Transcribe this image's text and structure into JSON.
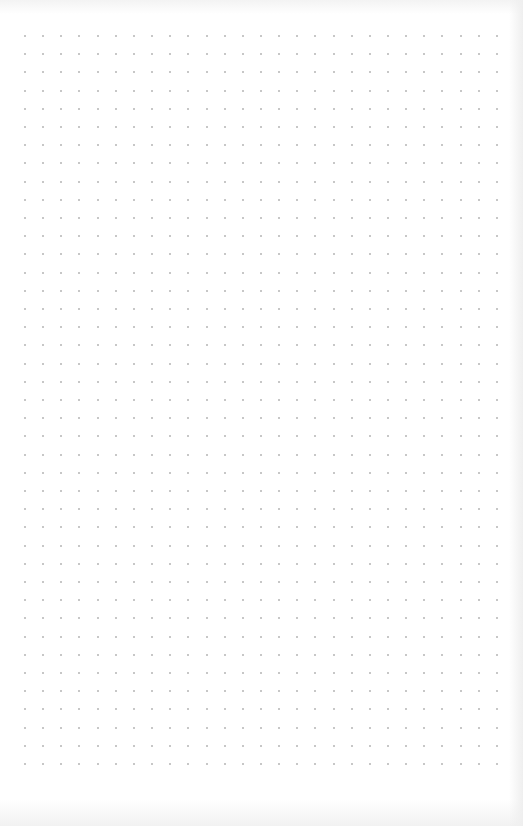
{
  "canvas": {
    "type": "dot-grid-paper",
    "background_color": "#ffffff",
    "dot_color": "#b4b4b4",
    "columns": 27,
    "rows": 41,
    "origin_x": 25,
    "origin_y": 36,
    "spacing_x": 18.15,
    "spacing_y": 18.2
  }
}
